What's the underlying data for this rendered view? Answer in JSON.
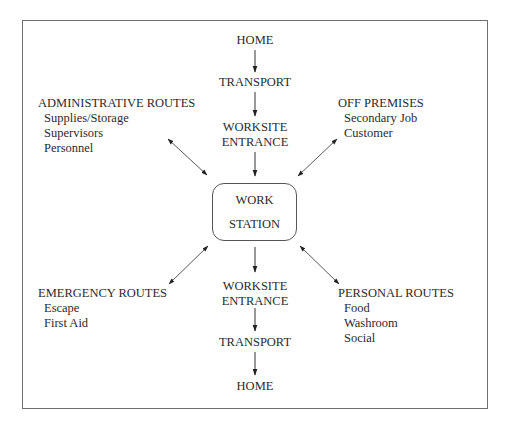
{
  "diagram": {
    "center": {
      "line1": "WORK",
      "line2": "STATION"
    },
    "inbound": {
      "start": "HOME",
      "transport": "TRANSPORT",
      "entrance_line1": "WORKSITE",
      "entrance_line2": "ENTRANCE"
    },
    "outbound": {
      "entrance_line1": "WORKSITE",
      "entrance_line2": "ENTRANCE",
      "transport": "TRANSPORT",
      "end": "HOME"
    },
    "administrative": {
      "heading": "ADMINISTRATIVE ROUTES",
      "items": [
        "Supplies/Storage",
        "Supervisors",
        "Personnel"
      ]
    },
    "off_premises": {
      "heading": "OFF PREMISES",
      "items": [
        "Secondary Job",
        "Customer"
      ]
    },
    "emergency": {
      "heading": "EMERGENCY ROUTES",
      "items": [
        "Escape",
        "First Aid"
      ]
    },
    "personal": {
      "heading": "PERSONAL ROUTES",
      "items": [
        "Food",
        "Washroom",
        "Social"
      ]
    },
    "colors": {
      "frame": "#6e6e6e",
      "text": "#2b2b2b",
      "arrow": "#333333",
      "background": "#ffffff"
    }
  }
}
